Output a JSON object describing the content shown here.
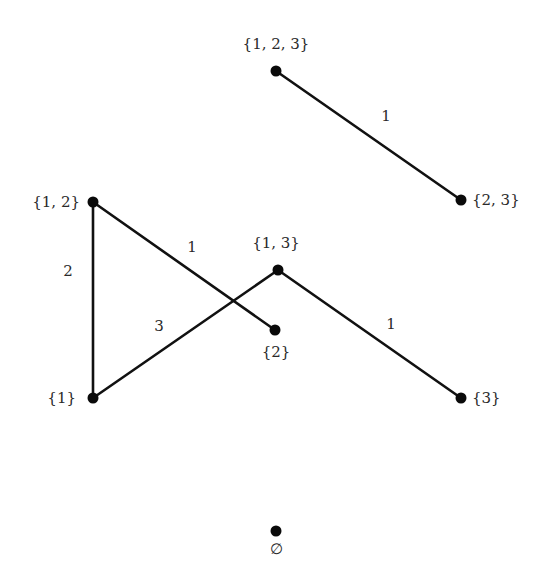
{
  "diagram": {
    "type": "graph",
    "colors": {
      "background": "#ffffff",
      "edge": "#111111",
      "vertex": "#0a0a0a",
      "text": "#2a2a2a"
    },
    "nodes": [
      {
        "id": "n123",
        "label": "{1, 2, 3}",
        "x": 276,
        "y": 71,
        "label_x": 276,
        "label_y": 49,
        "anchor": "middle"
      },
      {
        "id": "n23",
        "label": "{2, 3}",
        "x": 461,
        "y": 200,
        "label_x": 472,
        "label_y": 205,
        "anchor": "start"
      },
      {
        "id": "n12",
        "label": "{1, 2}",
        "x": 93,
        "y": 202,
        "label_x": 80,
        "label_y": 207,
        "anchor": "end"
      },
      {
        "id": "n13",
        "label": "{1, 3}",
        "x": 278,
        "y": 270,
        "label_x": 276,
        "label_y": 248,
        "anchor": "middle"
      },
      {
        "id": "n2",
        "label": "{2}",
        "x": 275,
        "y": 330,
        "label_x": 276,
        "label_y": 357,
        "anchor": "middle"
      },
      {
        "id": "n1",
        "label": "{1}",
        "x": 93,
        "y": 398,
        "label_x": 76,
        "label_y": 403,
        "anchor": "end"
      },
      {
        "id": "n3",
        "label": "{3}",
        "x": 461,
        "y": 398,
        "label_x": 472,
        "label_y": 403,
        "anchor": "start"
      },
      {
        "id": "nempty",
        "label": "∅",
        "x": 276,
        "y": 531,
        "label_x": 276,
        "label_y": 554,
        "anchor": "middle"
      }
    ],
    "edges": [
      {
        "from": "n123",
        "to": "n23",
        "x1": 276,
        "y1": 71,
        "x2": 461,
        "y2": 200,
        "label": "1",
        "label_x": 386,
        "label_y": 121
      },
      {
        "from": "n12",
        "to": "n2",
        "x1": 93,
        "y1": 202,
        "x2": 275,
        "y2": 330,
        "label": "1",
        "label_x": 192,
        "label_y": 252
      },
      {
        "from": "n12",
        "to": "n1",
        "x1": 93,
        "y1": 202,
        "x2": 93,
        "y2": 398,
        "label": "2",
        "label_x": 68,
        "label_y": 276
      },
      {
        "from": "n1",
        "to": "n13",
        "x1": 93,
        "y1": 398,
        "x2": 278,
        "y2": 270,
        "label": "3",
        "label_x": 159,
        "label_y": 331
      },
      {
        "from": "n13",
        "to": "n3",
        "x1": 278,
        "y1": 270,
        "x2": 461,
        "y2": 398,
        "label": "1",
        "label_x": 391,
        "label_y": 329
      }
    ]
  }
}
